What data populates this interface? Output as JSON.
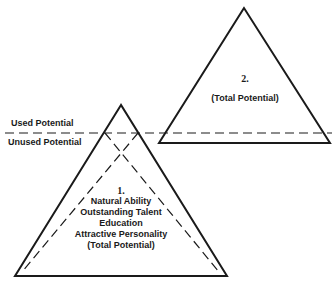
{
  "diagram": {
    "colors": {
      "stroke": "#1a1a1a",
      "background": "#ffffff"
    },
    "divider": {
      "above_label": "Used Potential",
      "below_label": "Unused Potential"
    },
    "triangle_1": {
      "number": "1.",
      "lines": [
        "Natural Ability",
        "Outstanding Talent",
        "Education",
        "Attractive Personality",
        "(Total Potential)"
      ]
    },
    "triangle_2": {
      "number": "2.",
      "caption": "(Total Potential)"
    }
  }
}
